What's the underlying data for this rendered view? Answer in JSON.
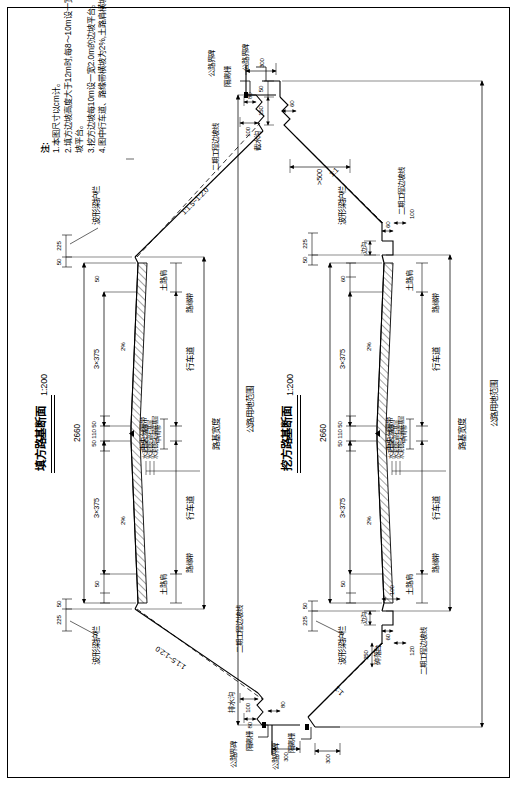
{
  "sheet": {
    "width": 519,
    "height": 787,
    "border_color": "#000000",
    "background": "#ffffff",
    "orientation_note": "drawing printed rotated 90 degrees"
  },
  "sections": [
    {
      "id": "fill",
      "title": "填方路基断面",
      "scale": "1:200",
      "total_width_label": "2660",
      "lane_group_left": "3×375",
      "lane_group_right": "3×375",
      "median_dims": "50 110 50",
      "shoulder_outer_left": "50",
      "shoulder_outer_right": "50",
      "shoulder_inner_left": "50",
      "shoulder_inner_right": "50",
      "guardrail_offset_left": "225",
      "guardrail_offset_right": "225",
      "crossfall_left": "2%",
      "crossfall_right": "2%",
      "side_slope": "1:1.5~1:2.0",
      "ditch_name": "排水沟",
      "ditch_top": "100",
      "ditch_depth": "80",
      "ditch_bottom": "80",
      "fence_offset": "300",
      "guardrail_label": "波形梁护栏",
      "stage2_slope_label": "二期工程边坡线",
      "fence_label": "隔离栅",
      "boundary_marker_label": "公路界碑",
      "shoulder_soil_label": "土路肩",
      "curb_strip_label": "路缘带",
      "lane_label": "行车道",
      "median_label": "中间带",
      "central_divider_label": "中央分隔带",
      "roadbed_width_label": "路基宽度",
      "row_label": "公路用地范围",
      "pavement_layers": [
        "水泥混凝土路面",
        "水泥稳定碎石基层",
        "水泥稳定石屑底基层"
      ]
    },
    {
      "id": "cut",
      "title": "挖方路基断面",
      "scale": "1:200",
      "total_width_label": "2660",
      "lane_group_left": "3×375",
      "lane_group_right": "3×375",
      "median_dims": "50 110 50",
      "shoulder_outer_left": "50",
      "shoulder_outer_right": "50",
      "shoulder_inner_left": "50",
      "shoulder_inner_right": "60",
      "guardrail_offset_left": "225",
      "guardrail_offset_right": "225",
      "crossfall_left": "2%",
      "crossfall_right": "2%",
      "side_slope": "1:1",
      "side_ditch_label": "边沟",
      "side_ditch_w": "60",
      "side_ditch_h1": "100",
      "side_ditch_h2": "60",
      "berm_label": "碎落台",
      "berm_w": "250",
      "berm_h1": "100",
      "berm_h2": "120",
      "intercept_ditch_label": "截水沟",
      "intercept_offset": ">500",
      "intercept_w": "150",
      "intercept_w2": "50",
      "intercept_d": "60",
      "fence_offset": "300",
      "guardrail_label": "波形梁护栏",
      "stage2_slope_label": "二期工程边坡线",
      "fence_label": "隔离栅",
      "boundary_marker_label": "公路界碑",
      "shoulder_soil_label": "土路肩",
      "curb_strip_label": "路缘带",
      "lane_label": "行车道",
      "median_label": "中间带",
      "central_divider_label": "中央分隔带",
      "roadbed_width_label": "路基宽度",
      "row_label": "公路用地范围",
      "slope_ditch_label": "边沟"
    }
  ],
  "notes": {
    "header": "注:",
    "items": [
      "1.本图尺寸以cm计。",
      "2.填方边坡高度大于12m时,每8～10m设一宽 2～3m的边",
      "   坡平台。",
      "3.挖方边坡每10m设一宽2.0m的边坡平台。",
      "4.图中行车道、路缘带横坡为2%,土路肩横坡为3%。"
    ]
  },
  "colors": {
    "line": "#000000",
    "hatch": "#000000",
    "dashed": "#000000"
  }
}
